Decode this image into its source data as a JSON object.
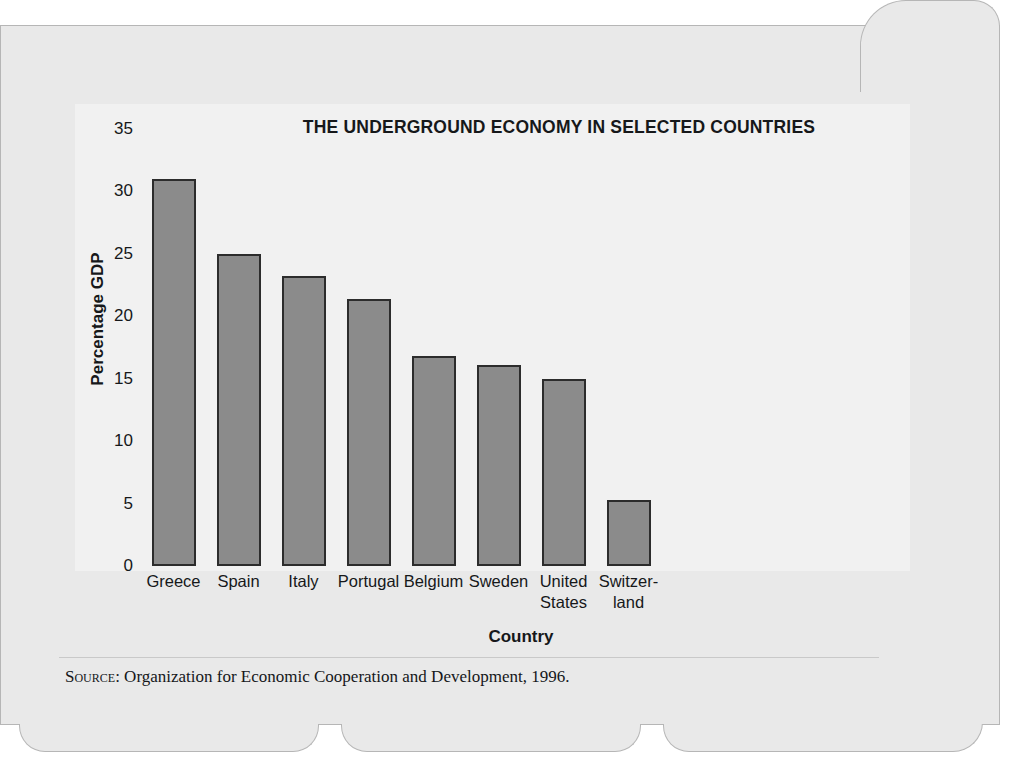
{
  "chart_data": {
    "type": "bar",
    "title": "THE UNDERGROUND ECONOMY IN SELECTED COUNTRIES",
    "xlabel": "Country",
    "ylabel": "Percentage GDP",
    "categories": [
      "Greece",
      "Spain",
      "Italy",
      "Portugal",
      "Belgium",
      "Sweden",
      "United States",
      "Switzerland"
    ],
    "category_lines": [
      [
        "Greece"
      ],
      [
        "Spain"
      ],
      [
        "Italy"
      ],
      [
        "Portugal"
      ],
      [
        "Belgium"
      ],
      [
        "Sweden"
      ],
      [
        "United",
        "States"
      ],
      [
        "Switzer-",
        "land"
      ]
    ],
    "values": [
      31.0,
      25.0,
      23.2,
      21.4,
      16.8,
      16.1,
      15.0,
      5.3
    ],
    "ylim": [
      0,
      35
    ],
    "yticks": [
      35,
      30,
      25,
      20,
      15,
      10,
      5,
      0
    ],
    "grid": false,
    "legend": false,
    "bar_color": "#8b8b8b",
    "bar_border_color": "#2c2c2c",
    "plot_background": "#f1f1f1",
    "page_background": "#e9e9e9"
  },
  "source": {
    "label": "Source",
    "text": ": Organization for Economic Cooperation and Development, 1996."
  }
}
